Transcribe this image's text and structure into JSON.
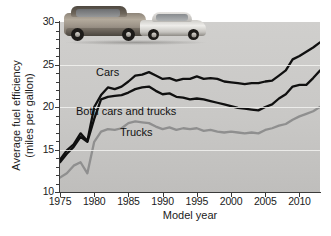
{
  "figure": {
    "caption_present": false
  },
  "axes": {
    "x_title": "Model year",
    "y_title_line1": "Average fuel efficiency",
    "y_title_line2": "(miles per gallon)",
    "x_ticks": [
      "1975",
      "1980",
      "1985",
      "1990",
      "1995",
      "2000",
      "2005",
      "2010"
    ],
    "y_ticks": [
      "10",
      "15",
      "20",
      "25",
      "30"
    ]
  },
  "series_labels": {
    "cars": "Cars",
    "both": "Both cars and trucks",
    "trucks": "Trucks"
  },
  "artwork": {
    "suv": "suv-photo",
    "sedan": "sedan-photo"
  },
  "colors": {
    "plot_background": "#c9c8c6",
    "gridline": "#f2f2f0",
    "cars_line": "#101010",
    "both_line": "#101010",
    "trucks_line": "#8f8f8f",
    "axis": "#3a3a3a",
    "text": "#1b1b1b"
  },
  "chart_data": {
    "type": "line",
    "title": "",
    "xlabel": "Model year",
    "ylabel": "Average fuel efficiency (miles per gallon)",
    "xlim": [
      1975,
      2013
    ],
    "ylim": [
      10,
      30
    ],
    "xticks": [
      1975,
      1980,
      1985,
      1990,
      1995,
      2000,
      2005,
      2010
    ],
    "yticks": [
      10,
      15,
      20,
      25,
      30
    ],
    "grid": true,
    "legend_position": "inline-labels",
    "x": [
      1975,
      1976,
      1977,
      1978,
      1979,
      1980,
      1981,
      1982,
      1983,
      1984,
      1985,
      1986,
      1987,
      1988,
      1989,
      1990,
      1991,
      1992,
      1993,
      1994,
      1995,
      1996,
      1997,
      1998,
      1999,
      2000,
      2001,
      2002,
      2003,
      2004,
      2005,
      2006,
      2007,
      2008,
      2009,
      2010,
      2011,
      2012,
      2013
    ],
    "series": [
      {
        "name": "Cars",
        "color": "#101010",
        "values": [
          13.8,
          14.9,
          15.6,
          16.9,
          16.0,
          20.0,
          21.4,
          22.3,
          22.1,
          22.4,
          23.0,
          23.7,
          23.8,
          24.1,
          23.7,
          23.3,
          23.4,
          23.1,
          23.3,
          23.3,
          23.6,
          23.3,
          23.4,
          23.3,
          23.0,
          22.9,
          22.8,
          22.7,
          22.8,
          22.8,
          23.0,
          23.1,
          23.7,
          24.3,
          25.6,
          26.0,
          26.5,
          27.0,
          27.6
        ]
      },
      {
        "name": "Both cars and trucks",
        "color": "#101010",
        "values": [
          13.5,
          14.5,
          15.3,
          16.5,
          15.9,
          18.6,
          20.9,
          21.2,
          21.3,
          21.4,
          21.7,
          22.1,
          22.3,
          22.4,
          21.9,
          21.5,
          21.6,
          21.2,
          21.1,
          20.9,
          21.0,
          20.9,
          20.7,
          20.5,
          20.3,
          20.1,
          19.9,
          19.8,
          19.7,
          19.6,
          20.0,
          20.3,
          21.0,
          21.5,
          22.4,
          22.6,
          22.6,
          23.4,
          24.3
        ]
      },
      {
        "name": "Trucks",
        "color": "#8f8f8f",
        "values": [
          11.7,
          12.2,
          13.1,
          13.5,
          12.2,
          15.9,
          17.1,
          17.4,
          17.3,
          17.5,
          18.1,
          18.3,
          18.2,
          18.1,
          17.7,
          17.4,
          17.6,
          17.3,
          17.5,
          17.4,
          17.5,
          17.2,
          17.3,
          17.1,
          17.0,
          17.1,
          17.0,
          16.9,
          17.0,
          16.9,
          17.3,
          17.5,
          17.8,
          18.0,
          18.5,
          18.9,
          19.2,
          19.5,
          20.0
        ]
      }
    ]
  }
}
